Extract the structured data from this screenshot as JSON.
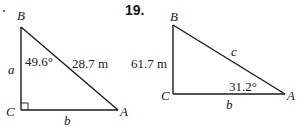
{
  "problems": [
    {
      "number": "",
      "triangle": {
        "vertices": {
          "B": "B",
          "C": "C",
          "A": "A"
        },
        "sides": {
          "a": "a",
          "b": "b",
          "hypotenuse": "28.7 m"
        },
        "angle_B": "49.6°",
        "right_angle_at": "C"
      }
    },
    {
      "number": "19.",
      "triangle": {
        "vertices": {
          "B": "B",
          "C": "C",
          "A": "A"
        },
        "sides": {
          "a": "61.7 m",
          "b": "b",
          "c": "c"
        },
        "angle_A": "31.2°",
        "right_angle_at": "C"
      }
    }
  ],
  "colors": {
    "line": "#1a1a1a",
    "background": "#ffffff"
  }
}
